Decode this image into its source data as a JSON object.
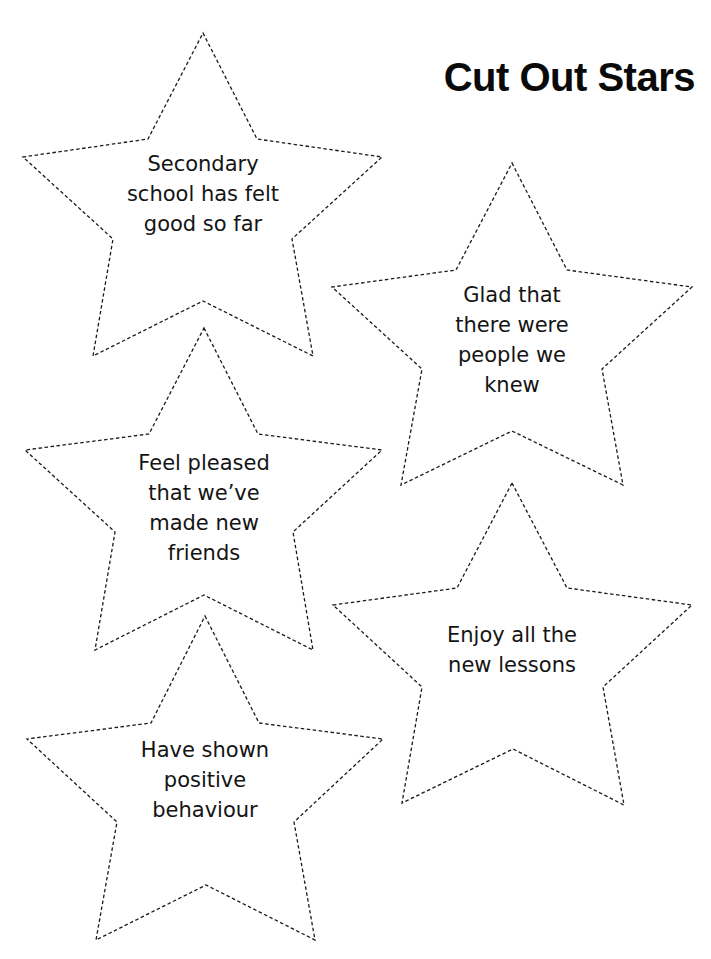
{
  "page": {
    "title": "Cut Out Stars"
  },
  "stars": [
    {
      "text": "Secondary\nschool has felt\ngood so far"
    },
    {
      "text": "Glad that\nthere were\npeople we\nknew"
    },
    {
      "text": "Feel pleased\nthat we’ve\nmade new\nfriends"
    },
    {
      "text": "Enjoy all the\nnew lessons"
    },
    {
      "text": "Have shown\npositive\nbehaviour"
    }
  ],
  "colors": {
    "ink": "#1a1a1a",
    "background": "#ffffff"
  }
}
